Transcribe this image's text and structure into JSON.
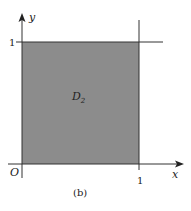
{
  "diagram": {
    "region_label": "D",
    "region_subscript": "2",
    "axis_x_label": "x",
    "axis_y_label": "y",
    "origin_label": "O",
    "tick_x": "1",
    "tick_y": "1",
    "caption": "(b)",
    "fill_color": "#8c8c8c",
    "line_color": "#333333"
  }
}
